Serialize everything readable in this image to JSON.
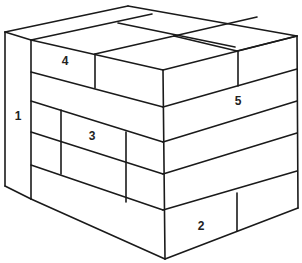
{
  "diagram": {
    "title": "",
    "labels": [
      {
        "id": "1",
        "text": "1",
        "part": "side-panel"
      },
      {
        "id": "2",
        "text": "2",
        "part": "bottom-front-block"
      },
      {
        "id": "3",
        "text": "3",
        "part": "middle-left-block"
      },
      {
        "id": "4",
        "text": "4",
        "part": "top-left-block"
      },
      {
        "id": "5",
        "text": "5",
        "part": "top-right-layer"
      }
    ],
    "line_color": "#1a1a1a",
    "background_color": "#ffffff"
  }
}
